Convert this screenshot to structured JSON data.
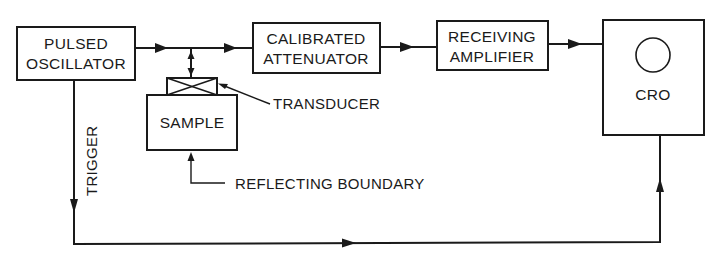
{
  "diagram": {
    "type": "block-diagram",
    "blocks": {
      "pulsed_oscillator": {
        "line1": "PULSED",
        "line2": "OSCILLATOR"
      },
      "calibrated_attenuator": {
        "line1": "CALIBRATED",
        "line2": "ATTENUATOR"
      },
      "receiving_amplifier": {
        "line1": "RECEIVING",
        "line2": "AMPLIFIER"
      },
      "sample": {
        "label": "SAMPLE"
      },
      "cro": {
        "label": "CRO"
      }
    },
    "annotations": {
      "transducer": "TRANSDUCER",
      "reflecting_boundary": "REFLECTING BOUNDARY",
      "trigger": "TRIGGER"
    },
    "connections": [
      {
        "from": "PULSED OSCILLATOR",
        "to": "CALIBRATED ATTENUATOR"
      },
      {
        "from": "signal line",
        "to": "TRANSDUCER",
        "bidirectional": true
      },
      {
        "from": "CALIBRATED ATTENUATOR",
        "to": "RECEIVING AMPLIFIER"
      },
      {
        "from": "RECEIVING AMPLIFIER",
        "to": "CRO"
      },
      {
        "from": "PULSED OSCILLATOR",
        "to": "CRO",
        "label": "TRIGGER"
      }
    ],
    "colors": {
      "ink": "#1a1a1a",
      "background": "#ffffff"
    }
  }
}
